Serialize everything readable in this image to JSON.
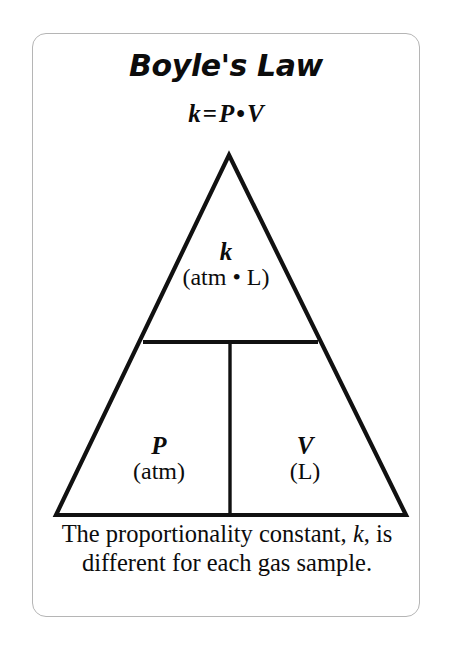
{
  "card": {
    "title": "Boyle's Law",
    "formula": {
      "left": "k",
      "equals": "=",
      "right_a": "P",
      "operator": "•",
      "right_b": "V",
      "full": "k = P • V"
    },
    "triangle": {
      "cells": [
        {
          "id": "k",
          "symbol": "k",
          "unit": "(atm • L)",
          "position": "top"
        },
        {
          "id": "p",
          "symbol": "P",
          "unit": "(atm)",
          "position": "bottom-left"
        },
        {
          "id": "v",
          "symbol": "V",
          "unit": "(L)",
          "position": "bottom-right"
        }
      ]
    },
    "caption": {
      "part1": "The proportionality constant, ",
      "italic": "k",
      "part2": ", is different for each gas sample.",
      "full": "The proportionality constant, k, is different for each gas sample."
    }
  },
  "colors": {
    "ink": "#0c0c0c",
    "card_border": "#b5b5b5",
    "background": "#ffffff",
    "diagram_stroke": "#111111"
  }
}
